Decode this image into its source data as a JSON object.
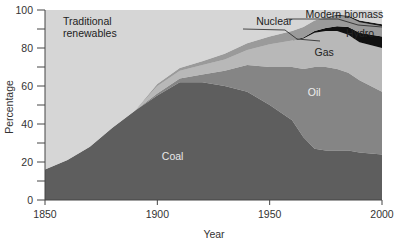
{
  "chart_data": {
    "type": "area",
    "title": "",
    "xlabel": "Year",
    "ylabel": "Percentage",
    "xlim": [
      1850,
      2000
    ],
    "ylim": [
      0,
      100
    ],
    "x_ticks": [
      "1850",
      "1900",
      "1950",
      "2000"
    ],
    "y_ticks": [
      "0",
      "20",
      "40",
      "60",
      "80",
      "100"
    ],
    "stacked": true,
    "x": [
      1850,
      1860,
      1870,
      1880,
      1890,
      1900,
      1910,
      1920,
      1930,
      1940,
      1950,
      1960,
      1965,
      1970,
      1975,
      1980,
      1985,
      1990,
      2000
    ],
    "series": [
      {
        "name": "Coal",
        "color": "#5e5e5e",
        "values": [
          16,
          21,
          28,
          38,
          47,
          55,
          62,
          62,
          60,
          57,
          50,
          42,
          33,
          27,
          26,
          26,
          26,
          25,
          24
        ]
      },
      {
        "name": "Oil",
        "color": "#858585",
        "values": [
          0,
          0,
          0,
          0,
          0,
          1,
          2,
          4,
          8,
          14,
          20,
          28,
          36,
          43,
          44,
          43,
          41,
          38,
          33
        ]
      },
      {
        "name": "Gas",
        "color": "#b8b8b8",
        "values": [
          0,
          0,
          0,
          0,
          0,
          4,
          4,
          5,
          6,
          8,
          12,
          14,
          16,
          18,
          19,
          20,
          20,
          20,
          23
        ]
      },
      {
        "name": "Nuclear",
        "color": "#101010",
        "values": [
          0,
          0,
          0,
          0,
          0,
          0,
          0,
          0,
          0,
          0,
          0,
          0,
          0.5,
          1,
          1.5,
          2.5,
          4,
          5,
          6
        ]
      },
      {
        "name": "Hydro",
        "color": "#9a9a9a",
        "values": [
          0,
          0,
          0,
          0,
          0,
          1,
          1.5,
          2,
          3,
          3.5,
          4,
          5,
          5.5,
          5.5,
          5.5,
          5.5,
          5.5,
          5.5,
          5.5
        ]
      },
      {
        "name": "Modern biomass",
        "color": "#1a1a1a",
        "values": [
          0,
          0,
          0,
          0,
          0,
          0,
          0,
          0,
          0,
          0,
          0,
          0,
          0,
          0,
          0,
          0.5,
          0.5,
          1,
          1
        ]
      },
      {
        "name": "Traditional renewables",
        "color": "#d6d6d6",
        "values": [
          84,
          79,
          72,
          62,
          53,
          39,
          30.5,
          27,
          23,
          17.5,
          14,
          11,
          9,
          5.5,
          4,
          2.5,
          3,
          5.5,
          7.5
        ]
      }
    ],
    "annotations": [
      {
        "text": "Traditional\nrenewables",
        "x": 1858,
        "y": 92
      },
      {
        "text": "Nuclear",
        "x": 1944,
        "y": 92
      },
      {
        "text": "Modern biomass",
        "x": 1966,
        "y": 96
      },
      {
        "text": "Hydro",
        "x": 1984,
        "y": 86
      },
      {
        "text": "Gas",
        "x": 1970,
        "y": 76
      },
      {
        "text": "Oil",
        "x": 1967,
        "y": 55
      },
      {
        "text": "Coal",
        "x": 1902,
        "y": 21
      }
    ],
    "grid": false,
    "legend": "none (inline labels)"
  }
}
